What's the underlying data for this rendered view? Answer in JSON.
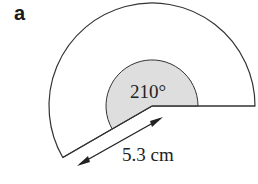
{
  "figure": {
    "part_label": "a",
    "shape": "sector",
    "angle_label": "210°",
    "radius_label": "5.3 cm",
    "fill_color": "#dedede",
    "stroke_color": "#333333"
  }
}
